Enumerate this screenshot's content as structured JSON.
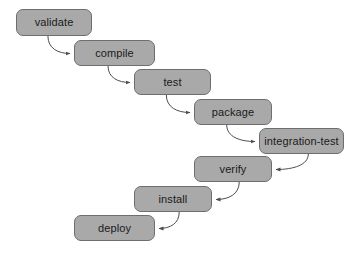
{
  "diagram": {
    "type": "flowchart",
    "orientation": "descending-staircase",
    "background_color": "#ffffff",
    "node_fill_color": "#a9a9a9",
    "node_border_color": "#6e6e6e",
    "node_text_color": "#1a1a1a",
    "edge_color": "#4d4d4d",
    "nodes": [
      {
        "id": "validate",
        "label": "validate",
        "x": 16,
        "y": 9,
        "w": 76,
        "h": 27
      },
      {
        "id": "compile",
        "label": "compile",
        "x": 74,
        "y": 40,
        "w": 81,
        "h": 26
      },
      {
        "id": "test",
        "label": "test",
        "x": 134,
        "y": 69,
        "w": 77,
        "h": 26
      },
      {
        "id": "package",
        "label": "package",
        "x": 194,
        "y": 99,
        "w": 78,
        "h": 26
      },
      {
        "id": "integration-test",
        "label": "integration-test",
        "x": 259,
        "y": 128,
        "w": 85,
        "h": 26
      },
      {
        "id": "verify",
        "label": "verify",
        "x": 194,
        "y": 156,
        "w": 78,
        "h": 26
      },
      {
        "id": "install",
        "label": "install",
        "x": 134,
        "y": 186,
        "w": 78,
        "h": 26
      },
      {
        "id": "deploy",
        "label": "deploy",
        "x": 74,
        "y": 215,
        "w": 81,
        "h": 26
      }
    ],
    "edges": [
      {
        "from": "validate",
        "to": "compile",
        "direction": "right"
      },
      {
        "from": "compile",
        "to": "test",
        "direction": "right"
      },
      {
        "from": "test",
        "to": "package",
        "direction": "right"
      },
      {
        "from": "package",
        "to": "integration-test",
        "direction": "right"
      },
      {
        "from": "integration-test",
        "to": "verify",
        "direction": "left"
      },
      {
        "from": "verify",
        "to": "install",
        "direction": "left"
      },
      {
        "from": "install",
        "to": "deploy",
        "direction": "left"
      }
    ]
  }
}
